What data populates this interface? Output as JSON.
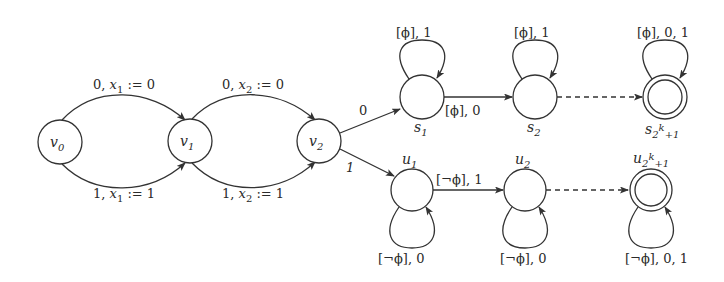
{
  "diagram": {
    "type": "automaton",
    "nodes": [
      {
        "id": "v0",
        "base": "v",
        "sub": "0",
        "x": 60,
        "y": 142,
        "accepting": false
      },
      {
        "id": "v1",
        "base": "v",
        "sub": "1",
        "x": 190,
        "y": 141,
        "accepting": false
      },
      {
        "id": "v2",
        "base": "v",
        "sub": "2",
        "x": 319,
        "y": 141,
        "accepting": false
      },
      {
        "id": "s1",
        "base": "s",
        "sub": "1",
        "x": 422,
        "y": 97,
        "accepting": false
      },
      {
        "id": "s2",
        "base": "s",
        "sub": "2",
        "x": 535,
        "y": 97,
        "accepting": false
      },
      {
        "id": "s2k1",
        "base": "s",
        "sub": "2k+1",
        "x": 665,
        "y": 97,
        "accepting": true
      },
      {
        "id": "u1",
        "base": "u",
        "sub": "1",
        "x": 412,
        "y": 190,
        "accepting": false
      },
      {
        "id": "u2",
        "base": "u",
        "sub": "2",
        "x": 525,
        "y": 190,
        "accepting": false
      },
      {
        "id": "u2k1",
        "base": "u",
        "sub": "2k+1",
        "x": 651,
        "y": 190,
        "accepting": true
      }
    ],
    "edges": [
      {
        "from": "v0",
        "to": "v1",
        "label": "0, x₁ := 0"
      },
      {
        "from": "v0",
        "to": "v1",
        "label": "1, x₁ := 1"
      },
      {
        "from": "v1",
        "to": "v2",
        "label": "0, x₂ := 0"
      },
      {
        "from": "v1",
        "to": "v2",
        "label": "1, x₂ := 1"
      },
      {
        "from": "v2",
        "to": "s1",
        "label": "0"
      },
      {
        "from": "v2",
        "to": "u1",
        "label": "1"
      },
      {
        "from": "s1",
        "to": "s1",
        "label": "[ϕ], 1"
      },
      {
        "from": "s1",
        "to": "s2",
        "label": "[ϕ], 0"
      },
      {
        "from": "s2",
        "to": "s2",
        "label": "[ϕ], 1"
      },
      {
        "from": "s2",
        "to": "s2k1",
        "label": "",
        "dashed": true
      },
      {
        "from": "s2k1",
        "to": "s2k1",
        "label": "[ϕ], 0, 1"
      },
      {
        "from": "u1",
        "to": "u1",
        "label": "[¬ϕ], 0"
      },
      {
        "from": "u1",
        "to": "u2",
        "label": "[¬ϕ], 1"
      },
      {
        "from": "u2",
        "to": "u2",
        "label": "[¬ϕ], 0"
      },
      {
        "from": "u2",
        "to": "u2k1",
        "label": "",
        "dashed": true
      },
      {
        "from": "u2k1",
        "to": "u2k1",
        "label": "[¬ϕ], 0, 1"
      }
    ]
  },
  "labels": {
    "v0": {
      "base": "v",
      "sub": "0"
    },
    "v1": {
      "base": "v",
      "sub": "1"
    },
    "v2": {
      "base": "v",
      "sub": "2"
    },
    "s1": {
      "base": "s",
      "sub": "1"
    },
    "s2": {
      "base": "s",
      "sub": "2"
    },
    "s2k1": {
      "base": "s",
      "sub": "2",
      "sup": "k",
      "tail": "+1"
    },
    "u1": {
      "base": "u",
      "sub": "1"
    },
    "u2": {
      "base": "u",
      "sub": "2"
    },
    "u2k1": {
      "base": "u",
      "sub": "2",
      "sup": "k",
      "tail": "+1"
    },
    "e_v0v1_top": {
      "pre": "0, ",
      "var": "x",
      "sub": "1",
      "post": " := 0"
    },
    "e_v0v1_bot": {
      "pre": "1, ",
      "var": "x",
      "sub": "1",
      "post": " := 1"
    },
    "e_v1v2_top": {
      "pre": "0, ",
      "var": "x",
      "sub": "2",
      "post": " := 0"
    },
    "e_v1v2_bot": {
      "pre": "1, ",
      "var": "x",
      "sub": "2",
      "post": " := 1"
    },
    "e_v2s1": "0",
    "e_v2u1": "1",
    "loop_s1": "[ϕ], 1",
    "e_s1s2": "[ϕ], 0",
    "loop_s2": "[ϕ], 1",
    "loop_s2k1": "[ϕ], 0, 1",
    "loop_u1": "[¬ϕ], 0",
    "e_u1u2": "[¬ϕ], 1",
    "loop_u2": "[¬ϕ], 0",
    "loop_u2k1": "[¬ϕ], 0, 1"
  }
}
